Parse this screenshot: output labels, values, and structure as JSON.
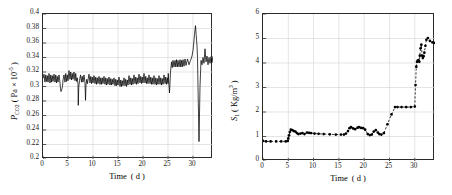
{
  "figure": {
    "background": "#ffffff",
    "axis_color": "#2b2b2b",
    "grid_color": "#d9d9d9",
    "data_color": "#000000"
  },
  "chart_data": [
    {
      "id": "left",
      "type": "line",
      "title": "",
      "xlabel_html": "Time&nbsp; ( d )",
      "ylabel_html": "<i>P</i><sub>CO2</sub>&nbsp;( Pa &times; 10<sup>-5</sup> )",
      "xlabel_plain": "Time ( d )",
      "ylabel_plain": "P_CO2 ( Pa x 10^-5 )",
      "xlim": [
        0,
        34
      ],
      "ylim": [
        0.2,
        0.4
      ],
      "xticks": [
        0,
        5,
        10,
        15,
        20,
        25,
        30
      ],
      "yticks": [
        0.2,
        0.22,
        0.24,
        0.26,
        0.28,
        0.3,
        0.32,
        0.34,
        0.36,
        0.38,
        0.4
      ],
      "ytick_labels": [
        "0.2",
        "0.22",
        "0.24",
        "0.26",
        "0.28",
        "0.3",
        "0.32",
        "0.34",
        "0.36",
        "0.38",
        "0.4"
      ],
      "xtick_labels": [
        "0",
        "5",
        "10",
        "15",
        "20",
        "25",
        "30"
      ],
      "grid": true,
      "legend": "none",
      "line_style": "solid",
      "marker": "none",
      "description": "Daily sawtooth oscillation near 0.305-0.320 for days 0-25, step up to ~0.330-0.345 after day 25, sharp peak 0.384 at day 30, deep drop to 0.224 at day 30.8, recovery to ~0.335",
      "x": [
        0,
        0.2,
        0.4,
        0.55,
        0.7,
        0.85,
        1,
        1.2,
        1.4,
        1.55,
        1.7,
        1.85,
        2,
        2.2,
        2.4,
        2.55,
        2.7,
        2.85,
        3,
        3.2,
        3.4,
        3.5,
        3.6,
        3.75,
        3.9,
        4,
        4.2,
        4.4,
        4.55,
        4.7,
        4.85,
        5,
        5.2,
        5.4,
        5.55,
        5.7,
        5.85,
        6,
        6.2,
        6.4,
        6.55,
        6.7,
        6.85,
        7,
        7.05,
        7.15,
        7.3,
        7.5,
        7.7,
        7.85,
        8,
        8.2,
        8.4,
        8.5,
        8.6,
        8.75,
        8.9,
        9,
        9.2,
        9.4,
        9.55,
        9.7,
        9.85,
        10,
        10.2,
        10.4,
        10.55,
        10.7,
        10.85,
        11,
        11.2,
        11.4,
        11.55,
        11.7,
        11.85,
        12,
        12.2,
        12.4,
        12.55,
        12.7,
        12.85,
        13,
        13.2,
        13.4,
        13.55,
        13.7,
        13.85,
        14,
        14.2,
        14.4,
        14.55,
        14.7,
        14.85,
        15,
        15.2,
        15.4,
        15.55,
        15.7,
        15.85,
        16,
        16.2,
        16.4,
        16.55,
        16.7,
        16.85,
        17,
        17.2,
        17.4,
        17.55,
        17.7,
        17.85,
        18,
        18.2,
        18.4,
        18.55,
        18.7,
        18.85,
        19,
        19.2,
        19.4,
        19.55,
        19.7,
        19.85,
        20,
        20.2,
        20.4,
        20.55,
        20.7,
        20.85,
        21,
        21.2,
        21.4,
        21.55,
        21.7,
        21.85,
        22,
        22.2,
        22.4,
        22.55,
        22.7,
        22.85,
        23,
        23.2,
        23.4,
        23.55,
        23.7,
        23.85,
        24,
        24.2,
        24.4,
        24.55,
        24.7,
        24.85,
        25,
        25.05,
        25.15,
        25.3,
        25.5,
        25.7,
        25.85,
        26,
        26.2,
        26.4,
        26.55,
        26.7,
        26.85,
        27,
        27.2,
        27.4,
        27.55,
        27.7,
        27.85,
        28,
        28.2,
        28.4,
        28.6,
        28.9,
        29.2,
        29.5,
        29.8,
        30,
        30.15,
        30.3,
        30.5,
        30.65,
        30.8,
        30.9,
        31,
        31.2,
        31.4,
        31.6,
        31.8,
        32,
        32.2,
        32.4,
        32.6,
        32.8,
        33,
        33.2,
        33.4,
        33.6,
        33.8,
        34
      ],
      "y": [
        0.311,
        0.317,
        0.306,
        0.316,
        0.307,
        0.315,
        0.306,
        0.318,
        0.305,
        0.316,
        0.306,
        0.315,
        0.307,
        0.317,
        0.306,
        0.316,
        0.305,
        0.314,
        0.306,
        0.316,
        0.305,
        0.297,
        0.293,
        0.296,
        0.3,
        0.309,
        0.316,
        0.306,
        0.318,
        0.307,
        0.316,
        0.308,
        0.322,
        0.31,
        0.32,
        0.309,
        0.318,
        0.31,
        0.32,
        0.308,
        0.318,
        0.307,
        0.312,
        0.303,
        0.274,
        0.299,
        0.308,
        0.316,
        0.306,
        0.314,
        0.306,
        0.316,
        0.305,
        0.281,
        0.302,
        0.31,
        0.304,
        0.309,
        0.317,
        0.305,
        0.314,
        0.304,
        0.313,
        0.305,
        0.315,
        0.304,
        0.313,
        0.303,
        0.312,
        0.304,
        0.314,
        0.303,
        0.312,
        0.303,
        0.312,
        0.304,
        0.314,
        0.303,
        0.312,
        0.302,
        0.311,
        0.303,
        0.313,
        0.302,
        0.311,
        0.302,
        0.31,
        0.303,
        0.312,
        0.301,
        0.31,
        0.301,
        0.309,
        0.302,
        0.313,
        0.3,
        0.309,
        0.3,
        0.308,
        0.301,
        0.312,
        0.301,
        0.31,
        0.3,
        0.309,
        0.302,
        0.315,
        0.303,
        0.312,
        0.302,
        0.311,
        0.303,
        0.316,
        0.304,
        0.313,
        0.303,
        0.312,
        0.304,
        0.317,
        0.305,
        0.314,
        0.304,
        0.313,
        0.305,
        0.318,
        0.305,
        0.314,
        0.304,
        0.312,
        0.304,
        0.316,
        0.304,
        0.313,
        0.303,
        0.312,
        0.303,
        0.315,
        0.303,
        0.312,
        0.302,
        0.311,
        0.303,
        0.315,
        0.303,
        0.312,
        0.302,
        0.311,
        0.303,
        0.316,
        0.304,
        0.313,
        0.303,
        0.312,
        0.304,
        0.318,
        0.306,
        0.291,
        0.32,
        0.334,
        0.326,
        0.336,
        0.327,
        0.336,
        0.327,
        0.337,
        0.327,
        0.336,
        0.327,
        0.337,
        0.327,
        0.336,
        0.327,
        0.337,
        0.328,
        0.338,
        0.329,
        0.338,
        0.33,
        0.336,
        0.342,
        0.35,
        0.36,
        0.372,
        0.384,
        0.37,
        0.356,
        0.34,
        0.3,
        0.224,
        0.3,
        0.336,
        0.33,
        0.34,
        0.332,
        0.352,
        0.334,
        0.342,
        0.33,
        0.34,
        0.332,
        0.341,
        0.333,
        0.342,
        0.331,
        0.34,
        0.333,
        0.338
      ]
    },
    {
      "id": "right",
      "type": "line",
      "title": "",
      "xlabel_html": "Time&nbsp; ( d )",
      "ylabel_html": "<i>S</i><sub>1</sub>&nbsp;( Kg/m<sup>3</sup> )",
      "xlabel_plain": "Time ( d )",
      "ylabel_plain": "S_1 ( Kg/m^3 )",
      "xlim": [
        0,
        34
      ],
      "ylim": [
        0,
        6
      ],
      "xticks": [
        0,
        5,
        10,
        15,
        20,
        25,
        30
      ],
      "yticks": [
        0,
        1,
        2,
        3,
        4,
        5,
        6
      ],
      "ytick_labels": [
        "0",
        "1",
        "2",
        "3",
        "4",
        "5",
        "6"
      ],
      "xtick_labels": [
        "0",
        "5",
        "10",
        "15",
        "20",
        "25",
        "30"
      ],
      "grid": true,
      "legend": "none",
      "line_style": "dashed",
      "marker": "circle",
      "description": "Flat at ~0.8 to day 5, jump to ~1.3 then settle ~1.1-1.2 through day 16, ~1.3-1.4 days 17-20, dip ~1.0 day 21-23, step to ~2.2 at day 26 holding to day 30, then sharp rise to ~4.1-5.0 by day 31-32, ending ~4.8",
      "x": [
        0,
        0.6,
        1.5,
        2.6,
        3.6,
        4.5,
        4.9,
        5.0,
        5.15,
        5.3,
        5.5,
        5.8,
        6.1,
        6.4,
        6.7,
        7.0,
        7.4,
        7.8,
        8.2,
        8.7,
        9.1,
        9.5,
        10.2,
        11.0,
        12.0,
        13.2,
        14.4,
        15.4,
        16.0,
        16.4,
        16.8,
        17.1,
        17.4,
        17.8,
        18.2,
        18.7,
        19.0,
        19.4,
        19.8,
        20.2,
        20.7,
        21.1,
        21.5,
        21.9,
        22.3,
        22.7,
        23.0,
        23.4,
        23.9,
        24.6,
        25.4,
        26.1,
        26.6,
        27.4,
        28.3,
        29.2,
        30.0,
        30.15,
        30.3,
        30.45,
        30.6,
        30.75,
        30.9,
        31.0,
        31.15,
        31.3,
        31.45,
        31.6,
        31.75,
        31.9,
        32.1,
        32.3,
        32.6,
        33.0,
        33.5,
        34.0
      ],
      "y": [
        0.82,
        0.8,
        0.8,
        0.8,
        0.8,
        0.8,
        0.82,
        0.92,
        1.05,
        1.18,
        1.28,
        1.26,
        1.22,
        1.2,
        1.14,
        1.1,
        1.12,
        1.14,
        1.1,
        1.16,
        1.15,
        1.14,
        1.12,
        1.11,
        1.1,
        1.09,
        1.08,
        1.08,
        1.08,
        1.12,
        1.22,
        1.34,
        1.38,
        1.33,
        1.3,
        1.36,
        1.38,
        1.35,
        1.34,
        1.28,
        1.1,
        1.06,
        1.08,
        1.2,
        1.26,
        1.16,
        1.1,
        1.08,
        1.14,
        1.5,
        1.9,
        2.2,
        2.2,
        2.2,
        2.2,
        2.2,
        2.22,
        3.1,
        3.85,
        4.05,
        4.1,
        4.12,
        4.05,
        4.3,
        4.6,
        4.75,
        4.3,
        4.2,
        4.28,
        4.42,
        4.7,
        4.95,
        5.02,
        4.9,
        4.84,
        4.82
      ]
    }
  ]
}
